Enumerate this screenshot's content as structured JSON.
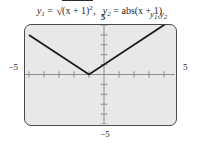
{
  "caption": {
    "eq1": {
      "lhs_var": "y",
      "lhs_sub": "1",
      "equals": "=",
      "radical": "√",
      "radicand": "(x + 1)",
      "exponent": "2",
      "trailing": ",",
      "full_text": "y1 = √((x + 1)2),"
    },
    "eq2": {
      "lhs_var": "y",
      "lhs_sub": "2",
      "equals": "=",
      "rhs": "abs(x + 1)",
      "full_text": "y2 = abs(x + 1)"
    }
  },
  "curve_label": {
    "var": "y",
    "sub1": "1",
    "comma": ",",
    "var2": "y",
    "sub2": "2",
    "full_text": "y1, y2"
  },
  "axis_labels": {
    "ymax": "5",
    "ymin": "−5",
    "xmin": "−5",
    "xmax": "5"
  },
  "colors": {
    "screen_background": "#e8e8e8",
    "screen_border": "#4a4a4a",
    "axis": "#8c8c8c",
    "curve": "#1a1a1a",
    "text": "#262626",
    "page_background": "#ffffff"
  },
  "chart_data": {
    "type": "line",
    "xlabel": "",
    "ylabel": "",
    "xlim": [
      -5,
      5
    ],
    "ylim": [
      -5,
      5
    ],
    "grid": false,
    "legend_position": "inside-top-right",
    "axis_tick_step": 1,
    "annotations": [
      {
        "text": "y1, y2",
        "x": 4.4,
        "y": 5.4
      }
    ],
    "series": [
      {
        "name": "y1, y2",
        "note": "both equations coincide: V-shape with vertex at x = -1",
        "x": [
          -5,
          -1,
          5
        ],
        "values": [
          4,
          0,
          6
        ]
      }
    ]
  }
}
